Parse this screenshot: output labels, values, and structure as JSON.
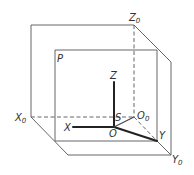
{
  "diagram": {
    "title": "",
    "colors": {
      "line": "#555555",
      "axis": "#222222",
      "text": "#333333"
    },
    "labels": {
      "z0": {
        "main": "Z",
        "sub": "0"
      },
      "x0": {
        "main": "X",
        "sub": "0"
      },
      "y0": {
        "main": "Y",
        "sub": "0"
      },
      "o0": {
        "main": "O",
        "sub": "0"
      },
      "p": "P",
      "z": "Z",
      "x": "X",
      "y": "Y",
      "s": "S",
      "o": "O"
    }
  }
}
